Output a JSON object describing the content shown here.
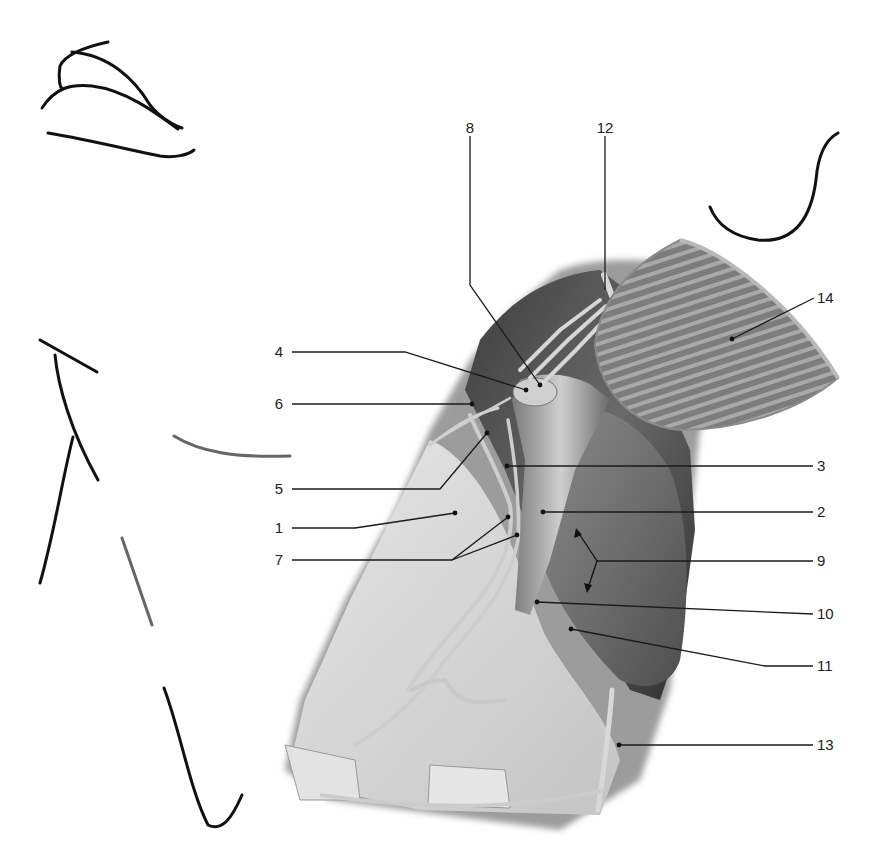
{
  "figure": {
    "type": "anatomical-illustration",
    "style": "grayscale pencil rendering with numbered leader-line callouts",
    "background": "#ffffff",
    "colors": {
      "ink": "#111111",
      "leader": "#1a1a1a",
      "tissue_light": "#d8d8d8",
      "tissue_mid": "#9a9a9a",
      "tissue_dark": "#4a4a4a",
      "vessel": "#bdbdbd"
    }
  },
  "labels": [
    {
      "id": "1",
      "text": "1",
      "side": "left",
      "text_x": 280,
      "text_y": 520,
      "target": [
        455,
        513
      ]
    },
    {
      "id": "2",
      "text": "2",
      "side": "right",
      "text_x": 818,
      "text_y": 512,
      "target": [
        543,
        512
      ]
    },
    {
      "id": "3",
      "text": "3",
      "side": "right",
      "text_x": 818,
      "text_y": 466,
      "target": [
        507,
        466
      ]
    },
    {
      "id": "4",
      "text": "4",
      "side": "left",
      "text_x": 280,
      "text_y": 352,
      "target": [
        526,
        390
      ]
    },
    {
      "id": "5",
      "text": "5",
      "side": "left",
      "text_x": 280,
      "text_y": 489,
      "target": [
        487,
        433
      ]
    },
    {
      "id": "6",
      "text": "6",
      "side": "left",
      "text_x": 280,
      "text_y": 404,
      "target": [
        472,
        404
      ]
    },
    {
      "id": "7",
      "text": "7",
      "side": "left",
      "text_x": 280,
      "text_y": 560,
      "targets": [
        [
          508,
          517
        ],
        [
          517,
          535
        ]
      ]
    },
    {
      "id": "8",
      "text": "8",
      "side": "top",
      "text_x": 470,
      "text_y": 128,
      "target": [
        540,
        385
      ]
    },
    {
      "id": "9",
      "text": "9",
      "side": "right",
      "text_x": 818,
      "text_y": 561,
      "targets": [
        [
          578,
          532
        ],
        [
          588,
          588
        ]
      ]
    },
    {
      "id": "10",
      "text": "10",
      "side": "right",
      "text_x": 818,
      "text_y": 614,
      "target": [
        537,
        602
      ]
    },
    {
      "id": "11",
      "text": "11",
      "side": "right",
      "text_x": 818,
      "text_y": 666,
      "target": [
        571,
        629
      ]
    },
    {
      "id": "12",
      "text": "12",
      "side": "top",
      "text_x": 605,
      "text_y": 128,
      "target": [
        605,
        290
      ]
    },
    {
      "id": "13",
      "text": "13",
      "side": "right",
      "text_x": 818,
      "text_y": 745,
      "target": [
        619,
        745
      ]
    },
    {
      "id": "14",
      "text": "14",
      "side": "right",
      "text_x": 818,
      "text_y": 298,
      "target": [
        732,
        339
      ]
    }
  ]
}
